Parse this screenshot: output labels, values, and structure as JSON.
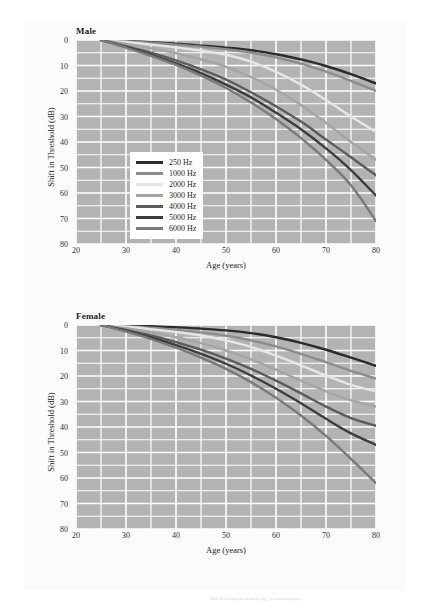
{
  "figure": {
    "caption_faint": "Shift in hearing threshold by age, sex and frequency"
  },
  "panels": [
    {
      "key": "male",
      "title": "Male",
      "xlabel": "Age (years)",
      "ylabel": "Shift in Threshold (dB)"
    },
    {
      "key": "female",
      "title": "Female",
      "xlabel": "Age (years)",
      "ylabel": "Shift in Threshold (dB)"
    }
  ],
  "legend": {
    "entries": [
      {
        "label": "250 Hz",
        "color": "#2b2b2b"
      },
      {
        "label": "1000 Hz",
        "color": "#8c8c8c"
      },
      {
        "label": "2000 Hz",
        "color": "#e6e6e6"
      },
      {
        "label": "3000 Hz",
        "color": "#a5a5a5"
      },
      {
        "label": "4000 Hz",
        "color": "#5c5c5c"
      },
      {
        "label": "5000 Hz",
        "color": "#3d3d3d"
      },
      {
        "label": "6000 Hz",
        "color": "#7a7a7a"
      }
    ]
  },
  "axes": {
    "x_ticks": [
      20,
      30,
      40,
      50,
      60,
      70,
      80
    ],
    "y_ticks": [
      0,
      10,
      20,
      30,
      40,
      50,
      60,
      70,
      80
    ],
    "x_minor_step": 5,
    "y_minor_step": 5,
    "xlim": [
      20,
      80
    ],
    "ylim": [
      0,
      80
    ],
    "y_inverted": true,
    "grid": true,
    "plot_bg": "#b3b3b3",
    "grid_color": "#ffffff"
  },
  "chart_data": [
    {
      "type": "line",
      "title": "Male",
      "xlabel": "Age (years)",
      "ylabel": "Shift in Threshold (dB)",
      "xlim": [
        20,
        80
      ],
      "ylim": [
        0,
        80
      ],
      "y_inverted": true,
      "grid": true,
      "legend_position": "inside-lower-left",
      "x": [
        25,
        30,
        35,
        40,
        45,
        50,
        55,
        60,
        65,
        70,
        75,
        80
      ],
      "series": [
        {
          "name": "250 Hz",
          "color": "#2b2b2b",
          "values": [
            0,
            0.4,
            0.9,
            1.5,
            2.2,
            3.0,
            4.0,
            5.6,
            7.6,
            10.2,
            13.4,
            17.0
          ]
        },
        {
          "name": "1000 Hz",
          "color": "#8c8c8c",
          "values": [
            0,
            0.5,
            1.1,
            1.8,
            2.6,
            3.6,
            4.9,
            6.8,
            9.3,
            12.4,
            16.0,
            20.0
          ]
        },
        {
          "name": "2000 Hz",
          "color": "#e6e6e6",
          "values": [
            0,
            0.8,
            1.8,
            2.9,
            4.2,
            5.8,
            8.5,
            12.5,
            17.5,
            23.5,
            30.0,
            36.0
          ]
        },
        {
          "name": "3000 Hz",
          "color": "#a5a5a5",
          "values": [
            0,
            1.5,
            3.2,
            5.2,
            7.6,
            10.5,
            14.5,
            19.5,
            25.5,
            32.5,
            40.0,
            47.0
          ]
        },
        {
          "name": "4000 Hz",
          "color": "#5c5c5c",
          "values": [
            0,
            2.4,
            5.0,
            8.0,
            11.5,
            15.5,
            20.5,
            26.0,
            32.0,
            39.0,
            46.0,
            53.0
          ]
        },
        {
          "name": "5000 Hz",
          "color": "#3d3d3d",
          "values": [
            0,
            2.8,
            5.8,
            9.2,
            13.0,
            17.5,
            22.5,
            28.5,
            35.0,
            42.5,
            51.0,
            61.0
          ]
        },
        {
          "name": "6000 Hz",
          "color": "#7a7a7a",
          "values": [
            0,
            3.0,
            6.2,
            9.8,
            14.0,
            18.8,
            24.5,
            31.0,
            38.5,
            47.0,
            57.0,
            71.0
          ]
        }
      ]
    },
    {
      "type": "line",
      "title": "Female",
      "xlabel": "Age (years)",
      "ylabel": "Shift in Threshold (dB)",
      "xlim": [
        20,
        80
      ],
      "ylim": [
        0,
        80
      ],
      "y_inverted": true,
      "grid": true,
      "legend_position": "inside-lower-left",
      "x": [
        25,
        30,
        35,
        40,
        45,
        50,
        55,
        60,
        65,
        70,
        75,
        80
      ],
      "series": [
        {
          "name": "250 Hz",
          "color": "#2b2b2b",
          "values": [
            0,
            0.2,
            0.5,
            0.9,
            1.4,
            2.1,
            3.2,
            4.8,
            7.0,
            9.7,
            12.8,
            16.0
          ]
        },
        {
          "name": "1000 Hz",
          "color": "#8c8c8c",
          "values": [
            0,
            0.5,
            1.1,
            1.9,
            2.9,
            4.2,
            6.0,
            8.4,
            11.3,
            14.6,
            18.0,
            21.0
          ]
        },
        {
          "name": "2000 Hz",
          "color": "#e6e6e6",
          "values": [
            0,
            0.7,
            1.6,
            2.7,
            4.1,
            6.0,
            8.6,
            12.0,
            15.8,
            19.8,
            23.5,
            26.0
          ]
        },
        {
          "name": "3000 Hz",
          "color": "#a5a5a5",
          "values": [
            0,
            1.3,
            2.9,
            4.8,
            7.1,
            10.0,
            13.5,
            17.5,
            21.8,
            26.0,
            29.5,
            32.0
          ]
        },
        {
          "name": "4000 Hz",
          "color": "#5c5c5c",
          "values": [
            0,
            1.9,
            4.1,
            6.7,
            9.7,
            13.2,
            17.2,
            21.8,
            26.8,
            32.0,
            36.5,
            39.5
          ]
        },
        {
          "name": "5000 Hz",
          "color": "#3d3d3d",
          "values": [
            0,
            2.3,
            4.9,
            7.9,
            11.3,
            15.2,
            19.8,
            25.0,
            30.7,
            36.8,
            42.5,
            47.0
          ]
        },
        {
          "name": "6000 Hz",
          "color": "#7a7a7a",
          "values": [
            0,
            2.6,
            5.5,
            8.9,
            12.8,
            17.2,
            22.4,
            28.5,
            35.5,
            43.5,
            52.5,
            62.0
          ]
        }
      ]
    }
  ]
}
